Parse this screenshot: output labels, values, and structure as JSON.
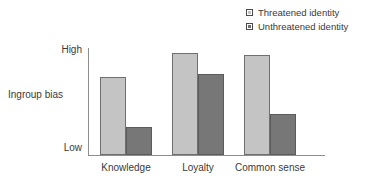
{
  "chart_data": {
    "type": "bar",
    "title": "",
    "xlabel": "",
    "ylabel": "Ingroup bias",
    "categories": [
      "Knowledge",
      "Loyalty",
      "Common sense"
    ],
    "series": [
      {
        "name": "Threatened identity",
        "values": [
          73,
          95,
          93
        ],
        "color": "#c4c4c4"
      },
      {
        "name": "Unthreatened identity",
        "values": [
          26,
          76,
          38
        ],
        "color": "#777777"
      }
    ],
    "ylim": [
      0,
      100
    ],
    "ytick_labels": [
      "High",
      "Low"
    ],
    "ytick_values": [
      100,
      0
    ],
    "grid": false,
    "legend_position": "top-right",
    "axis_color": "#8e8e8e",
    "background": "#ffffff"
  },
  "legend": {
    "items": [
      {
        "label": "Threatened identity",
        "swatch": "light-gray-square"
      },
      {
        "label": "Unthreatened identity",
        "swatch": "dark-gray-square"
      }
    ]
  },
  "axes": {
    "y_top_label": "High",
    "y_bottom_label": "Low",
    "y_axis_title": "Ingroup bias",
    "x_labels": [
      "Knowledge",
      "Loyalty",
      "Common sense"
    ]
  }
}
